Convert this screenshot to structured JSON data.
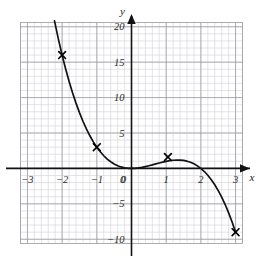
{
  "chart_data": {
    "type": "line",
    "title": "",
    "subtitle": "",
    "xlabel": "x",
    "ylabel": "y",
    "xlim": [
      -3.2,
      3.2
    ],
    "ylim": [
      -10.6,
      20.6
    ],
    "grid": true,
    "grid_minor": true,
    "grid_major_step_x": 1,
    "grid_major_step_y": 5,
    "grid_minor_step_x": 0.2,
    "grid_minor_step_y": 1,
    "legend": "none",
    "curve_expression": "y = 2x^2 - x^3",
    "series": [
      {
        "name": "y = 2x^2 - x^3",
        "x": [
          -2.22,
          -2.1,
          -2.0,
          -1.9,
          -1.8,
          -1.7,
          -1.6,
          -1.5,
          -1.4,
          -1.3,
          -1.2,
          -1.1,
          -1.0,
          -0.9,
          -0.8,
          -0.7,
          -0.6,
          -0.5,
          -0.4,
          -0.3,
          -0.2,
          -0.1,
          0.0,
          0.1,
          0.2,
          0.3,
          0.4,
          0.5,
          0.6,
          0.7,
          0.8,
          0.9,
          1.0,
          1.1,
          1.2,
          1.3,
          1.4,
          1.5,
          1.6,
          1.7,
          1.8,
          1.9,
          2.0,
          2.1,
          2.2,
          2.3,
          2.4,
          2.5,
          2.6,
          2.7,
          2.8,
          2.9,
          3.0
        ],
        "y": [
          20.82,
          18.08,
          16.0,
          14.08,
          12.31,
          10.69,
          9.22,
          7.88,
          6.66,
          5.58,
          4.61,
          3.75,
          3.0,
          2.35,
          1.79,
          1.32,
          0.94,
          0.63,
          0.38,
          0.21,
          0.09,
          0.02,
          0.0,
          0.02,
          0.07,
          0.15,
          0.26,
          0.38,
          0.5,
          0.64,
          0.77,
          0.89,
          1.0,
          1.09,
          1.15,
          1.18,
          1.18,
          1.13,
          1.02,
          0.87,
          0.65,
          0.36,
          0.0,
          -0.44,
          -0.97,
          -1.59,
          -2.3,
          -3.13,
          -4.06,
          -5.1,
          -6.27,
          -7.56,
          -9.0
        ]
      }
    ],
    "markers": [
      {
        "label": "(-2, 16)",
        "x": -2.0,
        "y": 16.0
      },
      {
        "label": "(-1, 3)",
        "x": -1.0,
        "y": 3.0
      },
      {
        "label": "(1, 1)",
        "x": 1.05,
        "y": 1.6
      },
      {
        "label": "(3, -9)",
        "x": 3.0,
        "y": -9.0
      }
    ],
    "x_ticks": [
      {
        "value": -3,
        "label": "-3"
      },
      {
        "value": -2,
        "label": "-2"
      },
      {
        "value": -1,
        "label": "-1"
      },
      {
        "value": 0,
        "label": "0"
      },
      {
        "value": 1,
        "label": "1"
      },
      {
        "value": 2,
        "label": "2"
      },
      {
        "value": 3,
        "label": "3"
      }
    ],
    "y_ticks": [
      {
        "value": 20,
        "label": "20"
      },
      {
        "value": 15,
        "label": "15"
      },
      {
        "value": 10,
        "label": "10"
      },
      {
        "value": 5,
        "label": "5"
      },
      {
        "value": 0,
        "label": "0"
      },
      {
        "value": -5,
        "label": "-5"
      },
      {
        "value": -10,
        "label": "-10"
      }
    ],
    "colors": {
      "curve": "#111111",
      "axis": "#111111",
      "grid_major": "#9a9aa2",
      "grid_minor": "#d2d2d8",
      "marker": "#000000",
      "background": "#ffffff",
      "text": "#1a1a1a"
    }
  }
}
